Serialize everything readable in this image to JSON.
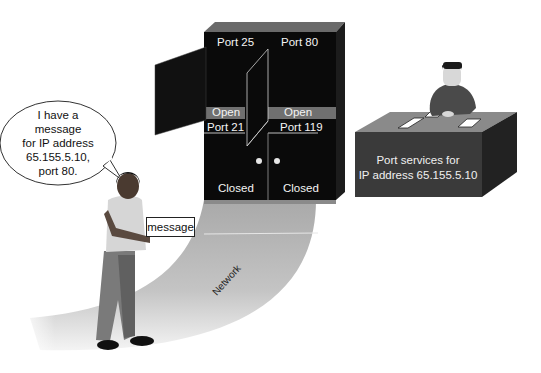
{
  "diagram": {
    "speech_bubble": {
      "lines": [
        "I have a",
        "message",
        "for IP address",
        "65.155.5.10,",
        "port 80."
      ]
    },
    "cabinet": {
      "ports": [
        {
          "label": "Port 25",
          "state": "Open",
          "door": "open"
        },
        {
          "label": "Port 80",
          "state": "Open",
          "door": "open"
        },
        {
          "label": "Port 21",
          "state": "Closed",
          "door": "closed"
        },
        {
          "label": "Port 119",
          "state": "Closed",
          "door": "closed"
        }
      ]
    },
    "message_label": "message",
    "network_label": "Network",
    "desk": {
      "lines": [
        "Port services for",
        "IP address 65.155.5.10"
      ]
    },
    "colors": {
      "cabinet": "#0a0a0a",
      "cabinet_top": "#6a6a6a",
      "open_band": "#6f6f6f",
      "network_path": "#b8b8b8",
      "desk_front": "#3a3a3a",
      "desk_top": "#8a8a8a",
      "desk_side": "#222222"
    }
  }
}
